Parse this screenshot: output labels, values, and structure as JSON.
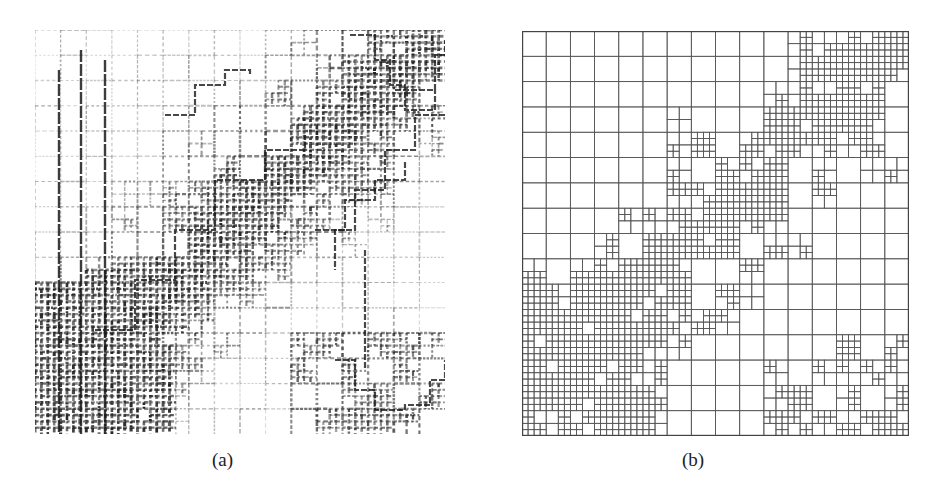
{
  "figure": {
    "panels": [
      {
        "id": "a",
        "caption": "(a)",
        "description": "Gray-level image overlaid with quadtree block boundaries (dark, noisy edges)",
        "ink_color": "#1a1a1a"
      },
      {
        "id": "b",
        "caption": "(b)",
        "description": "Quadtree decomposition grid",
        "line_color": "#555555",
        "top_level_blocks": 16,
        "max_depth": 2
      }
    ]
  }
}
